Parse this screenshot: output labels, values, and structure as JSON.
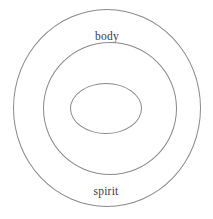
{
  "diagram": {
    "type": "concentric-circles",
    "title": "",
    "background_color": "#ffffff",
    "stroke_color": "#8a8a8a",
    "text_color": "#3a3a3a",
    "rings": [
      {
        "label": "body",
        "level": 1,
        "position": "outer",
        "center_x": 107,
        "center_y": 108,
        "diameter": 188,
        "label_x": 107,
        "label_y": 26
      },
      {
        "label": "soul",
        "level": 2,
        "position": "middle",
        "center_x": 110,
        "center_y": 108,
        "diameter": 134,
        "label_x": 107,
        "label_y": 63
      },
      {
        "label": "spirit",
        "level": 3,
        "position": "inner",
        "center_x": 106,
        "center_y": 108,
        "diameter": 72,
        "label_x": 106,
        "label_y": 107
      }
    ]
  }
}
